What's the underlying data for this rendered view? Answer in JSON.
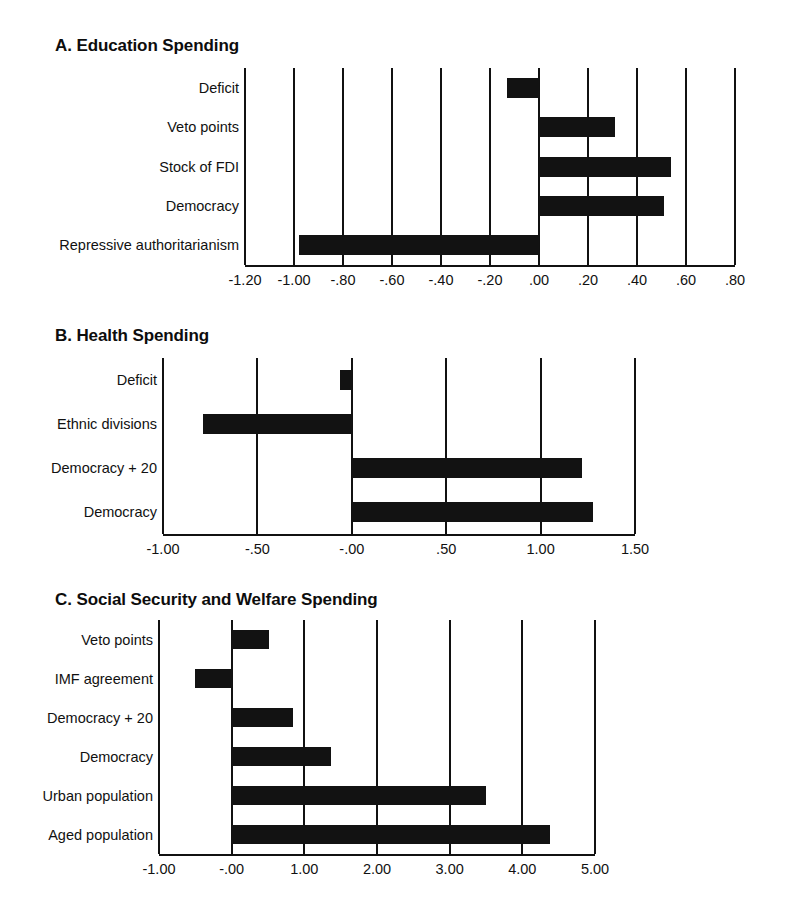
{
  "figure": {
    "background_color": "#ffffff",
    "bar_color": "#121212",
    "axis_color": "#111111"
  },
  "chart_data": [
    {
      "type": "bar",
      "orientation": "horizontal",
      "title": "A. Education Spending",
      "panel": "A",
      "xlabel": "",
      "ylabel": "",
      "xlim": [
        -1.2,
        0.8
      ],
      "xticks": [
        -1.2,
        -1.0,
        -0.8,
        -0.6,
        -0.4,
        -0.2,
        0.0,
        0.2,
        0.4,
        0.6,
        0.8
      ],
      "xticklabels": [
        "-1.20",
        "-1.00",
        "-.80",
        "-.60",
        "-.40",
        "-.20",
        ".00",
        ".20",
        ".40",
        ".60",
        ".80"
      ],
      "grid": true,
      "legend": "none",
      "categories": [
        "Deficit",
        "Veto points",
        "Stock of FDI",
        "Democracy",
        "Repressive authoritarianism"
      ],
      "values": [
        -0.13,
        0.31,
        0.54,
        0.51,
        -0.98
      ]
    },
    {
      "type": "bar",
      "orientation": "horizontal",
      "title": "B. Health Spending",
      "panel": "B",
      "xlabel": "",
      "ylabel": "",
      "xlim": [
        -1.0,
        1.5
      ],
      "xticks": [
        -1.0,
        -0.5,
        0.0,
        0.5,
        1.0,
        1.5
      ],
      "xticklabels": [
        "-1.00",
        "-.50",
        "-.00",
        ".50",
        "1.00",
        "1.50"
      ],
      "grid": true,
      "legend": "none",
      "categories": [
        "Deficit",
        "Ethnic divisions",
        "Democracy + 20",
        "Democracy"
      ],
      "values": [
        -0.06,
        -0.79,
        1.22,
        1.28
      ]
    },
    {
      "type": "bar",
      "orientation": "horizontal",
      "title": "C. Social Security and Welfare Spending",
      "panel": "C",
      "xlabel": "",
      "ylabel": "",
      "xlim": [
        -1.0,
        5.0
      ],
      "xticks": [
        -1.0,
        0.0,
        1.0,
        2.0,
        3.0,
        4.0,
        5.0
      ],
      "xticklabels": [
        "-1.00",
        "-.00",
        "1.00",
        "2.00",
        "3.00",
        "4.00",
        "5.00"
      ],
      "grid": true,
      "legend": "none",
      "categories": [
        "Veto points",
        "IMF agreement",
        "Democracy + 20",
        "Democracy",
        "Urban population",
        "Aged population"
      ],
      "values": [
        0.52,
        -0.5,
        0.84,
        1.37,
        3.5,
        4.38
      ]
    }
  ],
  "panels": {
    "a": {
      "title": "A. Education Spending",
      "categories": [
        "Deficit",
        "Veto points",
        "Stock of FDI",
        "Democracy",
        "Repressive authoritarianism"
      ],
      "ticklabels": [
        "-1.20",
        "-1.00",
        "-.80",
        "-.60",
        "-.40",
        "-.20",
        ".00",
        ".20",
        ".40",
        ".60",
        ".80"
      ]
    },
    "b": {
      "title": "B. Health Spending",
      "categories": [
        "Deficit",
        "Ethnic divisions",
        "Democracy + 20",
        "Democracy"
      ],
      "ticklabels": [
        "-1.00",
        "-.50",
        "-.00",
        ".50",
        "1.00",
        "1.50"
      ]
    },
    "c": {
      "title": "C. Social Security and Welfare Spending",
      "categories": [
        "Veto points",
        "IMF agreement",
        "Democracy + 20",
        "Democracy",
        "Urban population",
        "Aged population"
      ],
      "ticklabels": [
        "-1.00",
        "-.00",
        "1.00",
        "2.00",
        "3.00",
        "4.00",
        "5.00"
      ]
    }
  }
}
